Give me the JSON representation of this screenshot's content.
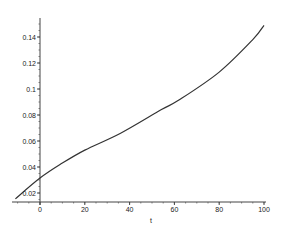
{
  "chart_data": {
    "type": "line",
    "title": "",
    "xlabel": "t",
    "ylabel": "",
    "xlim": [
      -11,
      100
    ],
    "ylim": [
      0.015,
      0.15
    ],
    "grid": false,
    "legend": null,
    "x_ticks": [
      0,
      20,
      40,
      60,
      80,
      100
    ],
    "x_tick_labels": [
      "0",
      "20",
      "40",
      "60",
      "80",
      "100"
    ],
    "y_ticks": [
      0.02,
      0.04,
      0.06,
      0.08,
      0.1,
      0.12,
      0.14
    ],
    "y_tick_labels": [
      "0.02",
      "0.04",
      "0.06",
      "0.08",
      "0.1",
      "0.12",
      "0.14"
    ],
    "series": [
      {
        "name": "curve",
        "color": "#333333",
        "x": [
          -11,
          0,
          10,
          20,
          36,
          54,
          62,
          80,
          95,
          100
        ],
        "y": [
          0.0155,
          0.0315,
          0.043,
          0.053,
          0.066,
          0.084,
          0.0915,
          0.113,
          0.138,
          0.149
        ]
      }
    ]
  }
}
